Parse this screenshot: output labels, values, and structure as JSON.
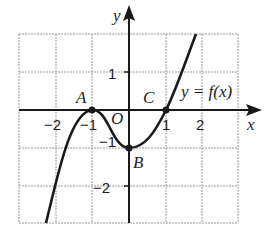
{
  "figure": {
    "axis_labels": {
      "x": "x",
      "y": "y"
    },
    "origin_label": "O",
    "function_label": "y = f(x)",
    "x_ticks": [
      {
        "value": -2,
        "label": "−2"
      },
      {
        "value": -1,
        "label": "−1"
      },
      {
        "value": 1,
        "label": "1"
      },
      {
        "value": 2,
        "label": "2"
      }
    ],
    "y_ticks": [
      {
        "value": 1,
        "label": "1"
      },
      {
        "value": -1,
        "label": "−1"
      },
      {
        "value": -2,
        "label": "−2"
      }
    ],
    "points": [
      {
        "name": "A",
        "x": -1,
        "y": 0
      },
      {
        "name": "B",
        "x": 0,
        "y": -1
      },
      {
        "name": "C",
        "x": 1,
        "y": 0
      }
    ],
    "grid": {
      "x_range": [
        -3,
        3
      ],
      "y_range": [
        -3,
        2
      ]
    },
    "colors": {
      "grid": "#9a9a9a",
      "axis": "#1a1a1a",
      "curve": "#1a1a1a"
    }
  }
}
